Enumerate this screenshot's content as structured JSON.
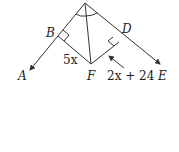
{
  "diagram": {
    "type": "geometry",
    "points": {
      "A": {
        "label": "A"
      },
      "B": {
        "label": "B"
      },
      "D": {
        "label": "D"
      },
      "E": {
        "label": "E"
      },
      "F": {
        "label": "F"
      }
    },
    "labels": {
      "BF": "5x",
      "DF": "2x + 24"
    },
    "markers": [
      "right-angle-B",
      "right-angle-D",
      "congruent-angle-arcs-at-vertex"
    ],
    "stroke_color": "#333333"
  }
}
